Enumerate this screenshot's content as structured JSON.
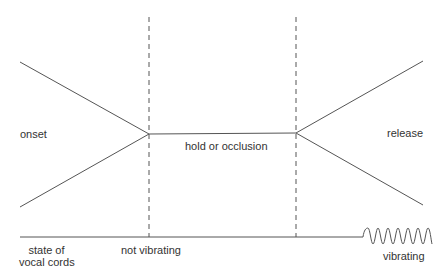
{
  "diagram": {
    "phases": {
      "onset": "onset",
      "hold": "hold or occlusion",
      "release": "release"
    },
    "vocal_cords": {
      "label_line1": "state of",
      "label_line2": "vocal cords",
      "not_vibrating": "not vibrating",
      "vibrating": "vibrating"
    },
    "colors": {
      "line": "#555555",
      "text": "#333333",
      "background": "#ffffff"
    }
  }
}
